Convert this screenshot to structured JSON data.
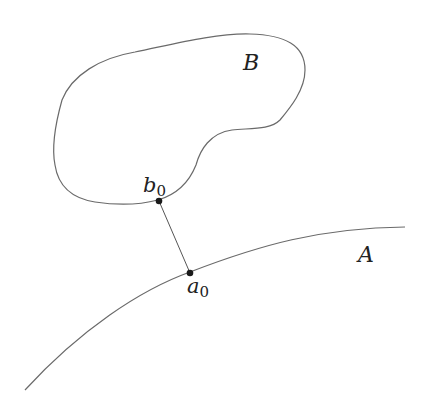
{
  "diagram": {
    "set_B": {
      "label": "B"
    },
    "set_A": {
      "label": "A"
    },
    "point_b0": {
      "label": "b",
      "subscript": "0"
    },
    "point_a0": {
      "label": "a",
      "subscript": "0"
    },
    "colors": {
      "stroke": "#6a6a6a",
      "point": "#1a1a1a",
      "text": "#222222"
    }
  }
}
